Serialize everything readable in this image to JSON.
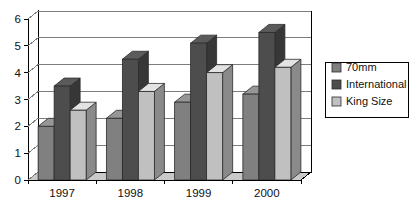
{
  "chart_data": {
    "type": "bar",
    "title": "",
    "subtitle": "",
    "xlabel": "",
    "ylabel": "",
    "categories": [
      "1997",
      "1998",
      "1999",
      "2000"
    ],
    "series": [
      {
        "name": "70mm",
        "values": [
          2.0,
          2.3,
          2.9,
          3.2
        ],
        "color": "#808080"
      },
      {
        "name": "International",
        "values": [
          3.5,
          4.5,
          5.1,
          5.5
        ],
        "color": "#4d4d4d"
      },
      {
        "name": "King Size",
        "values": [
          2.6,
          3.3,
          4.0,
          4.2
        ],
        "color": "#c0c0c0"
      }
    ],
    "ylim": [
      0,
      6
    ],
    "yticks": [
      0,
      1,
      2,
      3,
      4,
      5,
      6
    ],
    "ytick_labels": [
      "0",
      "1",
      "2",
      "3",
      "4",
      "5",
      "6"
    ],
    "grid": true,
    "grid_axis": "y",
    "legend_position": "right",
    "style": "3d-column",
    "background": "#ffffff"
  },
  "axis": {
    "y_tick_labels": [
      "6",
      "5",
      "4",
      "3",
      "2",
      "1",
      "0"
    ],
    "x_tick_labels": [
      "1997",
      "1998",
      "1999",
      "2000"
    ]
  },
  "legend": {
    "entries": [
      {
        "label": "70mm",
        "swatch_color": "#808080"
      },
      {
        "label": "International",
        "swatch_color": "#4d4d4d"
      },
      {
        "label": "King Size",
        "swatch_color": "#c0c0c0"
      }
    ]
  }
}
